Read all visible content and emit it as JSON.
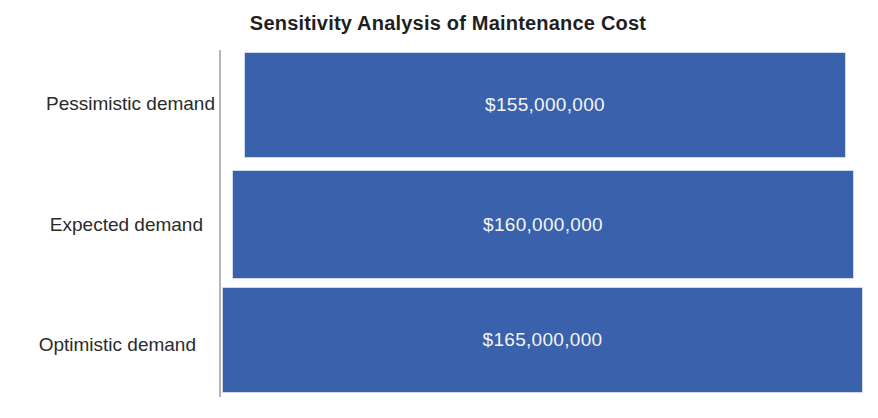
{
  "chart_data": {
    "type": "bar",
    "orientation": "horizontal",
    "title": "Sensitivity Analysis of Maintenance Cost",
    "categories": [
      "Pessimistic demand",
      "Expected demand",
      "Optimistic demand"
    ],
    "values": [
      155000000,
      160000000,
      165000000
    ],
    "value_labels": [
      "$155,000,000",
      "$160,000,000",
      "$165,000,000"
    ],
    "xlim": [
      0,
      165000000
    ],
    "grid": false,
    "legend": "none",
    "value_labels_position": "inside-center",
    "bar_color": "#3a62ac",
    "value_label_color": "#f4f4f2",
    "text_color": "#2b2b2b",
    "axis_line_color": "#b5b5b5",
    "background": "#ffffff"
  }
}
